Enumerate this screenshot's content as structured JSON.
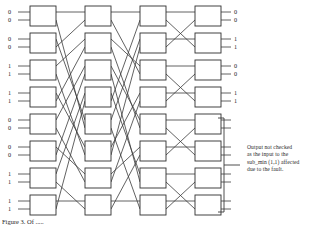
{
  "figure": {
    "type": "multistage-interconnection-network",
    "stages": 4,
    "switches_per_stage": 8,
    "switch_size": "2x2"
  },
  "inputs": {
    "label_pairs": [
      [
        "0",
        "0"
      ],
      [
        "0",
        "0"
      ],
      [
        "1",
        "1"
      ],
      [
        "1",
        "1"
      ],
      [
        "0",
        "0"
      ],
      [
        "0",
        "0"
      ],
      [
        "1",
        "1"
      ],
      [
        "1",
        "1"
      ]
    ]
  },
  "outputs": {
    "label_pairs": [
      [
        "0",
        "0"
      ],
      [
        "1",
        "1"
      ],
      [
        "0",
        "0"
      ],
      [
        "1",
        "1"
      ],
      [
        "",
        ""
      ],
      [
        "",
        ""
      ],
      [
        "",
        ""
      ],
      [
        "",
        ""
      ]
    ]
  },
  "annotation": {
    "line1": "Output  not checked",
    "line2": "as the input  to the",
    "line3": "sub_min (1,1) affected",
    "line4": "due to the fault.",
    "bracket_covers_outputs": [
      5,
      6,
      7,
      8
    ]
  },
  "caption": {
    "text": "Figure 3. Of ....."
  },
  "colors": {
    "line": "#3a3a3a",
    "box_stroke": "#2e2e2e",
    "box_fill": "#ffffff",
    "text": "#1f1f1f",
    "background": "#ffffff"
  },
  "chart_data": {
    "type": "diagram",
    "stage_x": [
      30,
      85,
      140,
      195
    ],
    "box_width": 26,
    "box_height": 20,
    "row_y": [
      6,
      33,
      60,
      87,
      114,
      141,
      168,
      195
    ],
    "permutation_stage1_to_2": [
      0,
      4,
      1,
      5,
      2,
      6,
      3,
      7
    ],
    "permutation_stage2_to_3": [
      0,
      2,
      4,
      6,
      1,
      3,
      5,
      7
    ],
    "permutation_stage3_to_4": [
      0,
      1,
      2,
      3,
      4,
      5,
      6,
      7
    ]
  }
}
